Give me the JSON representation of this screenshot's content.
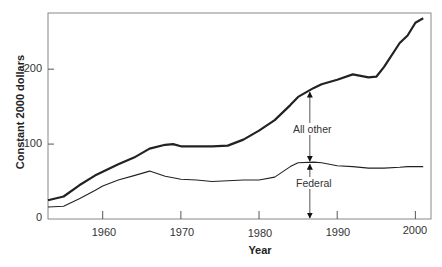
{
  "chart_data": {
    "type": "line",
    "title": "",
    "xlabel": "Year",
    "ylabel": "Constant 2000 dollars",
    "xlim": [
      1953,
      2002
    ],
    "ylim": [
      0,
      275
    ],
    "grid": false,
    "legend": "none (inline annotations)",
    "x_ticks": [
      1960,
      1970,
      1980,
      1990,
      2000
    ],
    "y_ticks": [
      0,
      100,
      200
    ],
    "x": [
      1953,
      1955,
      1957,
      1959,
      1960,
      1962,
      1964,
      1966,
      1968,
      1969,
      1970,
      1972,
      1974,
      1976,
      1978,
      1980,
      1982,
      1984,
      1985,
      1987,
      1988,
      1990,
      1992,
      1994,
      1995,
      1996,
      1998,
      1999,
      2000,
      2001
    ],
    "series": [
      {
        "name": "Total (Federal + All other)",
        "values": [
          25,
          30,
          45,
          58,
          63,
          73,
          82,
          94,
          99,
          100,
          97,
          97,
          97,
          98,
          106,
          118,
          132,
          152,
          163,
          175,
          180,
          186,
          193,
          189,
          190,
          203,
          235,
          245,
          262,
          268
        ]
      },
      {
        "name": "Federal",
        "values": [
          16,
          17,
          27,
          38,
          44,
          52,
          58,
          64,
          57,
          55,
          53,
          52,
          50,
          51,
          52,
          52,
          56,
          70,
          75,
          76,
          75,
          71,
          70,
          68,
          68,
          68,
          69,
          70,
          70,
          70
        ]
      }
    ],
    "annotations": [
      {
        "text": "All other",
        "x": 1986.5,
        "note": "double-headed arrow spanning Federal line to Total line"
      },
      {
        "text": "Federal",
        "x": 1986.5,
        "note": "double-headed arrow spanning 0 to Federal line"
      }
    ]
  },
  "labels": {
    "ylabel": "Constant 2000 dollars",
    "xlabel": "Year",
    "yticks": [
      "0",
      "100",
      "200"
    ],
    "xticks": [
      "1960",
      "1970",
      "1980",
      "1990",
      "2000"
    ],
    "all_other": "All other",
    "federal": "Federal"
  }
}
